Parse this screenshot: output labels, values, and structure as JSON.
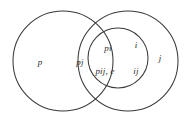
{
  "figure": {
    "name": "venn-diagram",
    "background_color": "#ffffff",
    "stroke_color": "#3a3a3a",
    "text_color": "#2b2b2b"
  },
  "circles": [
    {
      "id": "circle-p",
      "label_name": "circle-p",
      "cx": 63,
      "cy": 61,
      "r": 50
    },
    {
      "id": "circle-j",
      "label_name": "circle-j",
      "cx": 128,
      "cy": 61,
      "r": 50
    },
    {
      "id": "circle-i",
      "label_name": "circle-i",
      "cx": 118,
      "cy": 58,
      "r": 30
    }
  ],
  "regions": [
    {
      "id": "p",
      "text": "p",
      "x": 40,
      "y": 62
    },
    {
      "id": "pj",
      "text": "pj",
      "x": 80,
      "y": 62
    },
    {
      "id": "pi",
      "text": "pi",
      "x": 108,
      "y": 48
    },
    {
      "id": "pij_e",
      "text": "pij, e",
      "x": 105,
      "y": 71
    },
    {
      "id": "i",
      "text": "i",
      "x": 136,
      "y": 45
    },
    {
      "id": "ij",
      "text": "ij",
      "x": 136,
      "y": 71
    },
    {
      "id": "j",
      "text": "j",
      "x": 160,
      "y": 58
    }
  ]
}
